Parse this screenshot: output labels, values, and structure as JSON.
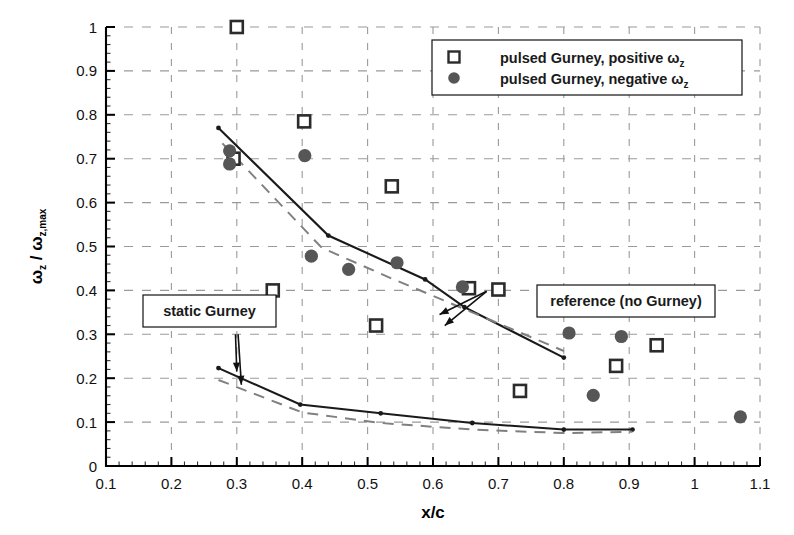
{
  "chart_data": {
    "type": "scatter",
    "title": "",
    "xlabel": "x/c",
    "ylabel": "ωz / ωz,max",
    "ylabel_parts": {
      "main1": "ω",
      "sub1": "z",
      "slash": " / ",
      "main2": "ω",
      "sub2": "z,max"
    },
    "xlim": [
      0.1,
      1.1
    ],
    "ylim": [
      0.0,
      1.0
    ],
    "xticks": [
      "0.1",
      "0.2",
      "0.3",
      "0.4",
      "0.5",
      "0.6",
      "0.7",
      "0.8",
      "0.9",
      "1",
      "1.1"
    ],
    "xtick_values": [
      0.1,
      0.2,
      0.3,
      0.4,
      0.5,
      0.6,
      0.7,
      0.8,
      0.9,
      1.0,
      1.1
    ],
    "yticks": [
      "0",
      "0.1",
      "0.2",
      "0.3",
      "0.4",
      "0.5",
      "0.6",
      "0.7",
      "0.8",
      "0.9",
      "1"
    ],
    "ytick_values": [
      0.0,
      0.1,
      0.2,
      0.3,
      0.4,
      0.5,
      0.6,
      0.7,
      0.8,
      0.9,
      1.0
    ],
    "grid": true,
    "grid_style": "dashed",
    "grid_color": "#9a9a9a",
    "minor_ticks_per_major": 5,
    "legend_position": "top-right",
    "series": [
      {
        "name": "pulsed Gurney, positive ωz",
        "marker": "open-square",
        "color": "#2b2b2b",
        "points": [
          {
            "x": 0.3,
            "y": 1.0
          },
          {
            "x": 0.295,
            "y": 0.7
          },
          {
            "x": 0.355,
            "y": 0.4
          },
          {
            "x": 0.403,
            "y": 0.785
          },
          {
            "x": 0.513,
            "y": 0.32
          },
          {
            "x": 0.537,
            "y": 0.637
          },
          {
            "x": 0.655,
            "y": 0.405
          },
          {
            "x": 0.7,
            "y": 0.402
          },
          {
            "x": 0.733,
            "y": 0.171
          },
          {
            "x": 0.88,
            "y": 0.228
          },
          {
            "x": 0.942,
            "y": 0.275
          }
        ]
      },
      {
        "name": "pulsed Gurney, negative ωz",
        "marker": "filled-circle",
        "color": "#565656",
        "points": [
          {
            "x": 0.289,
            "y": 0.718
          },
          {
            "x": 0.289,
            "y": 0.688
          },
          {
            "x": 0.404,
            "y": 0.707
          },
          {
            "x": 0.414,
            "y": 0.478
          },
          {
            "x": 0.471,
            "y": 0.448
          },
          {
            "x": 0.545,
            "y": 0.463
          },
          {
            "x": 0.645,
            "y": 0.408
          },
          {
            "x": 0.808,
            "y": 0.303
          },
          {
            "x": 0.845,
            "y": 0.161
          },
          {
            "x": 0.888,
            "y": 0.295
          },
          {
            "x": 1.07,
            "y": 0.112
          }
        ]
      }
    ],
    "curves": [
      {
        "name": "pulsed-gurney-trend-upper",
        "style": "solid",
        "color": "#1a1a1a",
        "points": [
          {
            "x": 0.272,
            "y": 0.77
          },
          {
            "x": 0.44,
            "y": 0.525
          },
          {
            "x": 0.588,
            "y": 0.425
          },
          {
            "x": 0.648,
            "y": 0.362
          },
          {
            "x": 0.8,
            "y": 0.247
          }
        ]
      },
      {
        "name": "reference-no-gurney-upper",
        "style": "dashed",
        "color": "#808080",
        "points": [
          {
            "x": 0.278,
            "y": 0.735
          },
          {
            "x": 0.43,
            "y": 0.497
          },
          {
            "x": 0.54,
            "y": 0.425
          },
          {
            "x": 0.66,
            "y": 0.35
          },
          {
            "x": 0.8,
            "y": 0.262
          }
        ]
      },
      {
        "name": "static-gurney-trend-lower",
        "style": "solid",
        "color": "#1a1a1a",
        "points": [
          {
            "x": 0.272,
            "y": 0.223
          },
          {
            "x": 0.397,
            "y": 0.14
          },
          {
            "x": 0.52,
            "y": 0.12
          },
          {
            "x": 0.66,
            "y": 0.098
          },
          {
            "x": 0.8,
            "y": 0.083
          },
          {
            "x": 0.905,
            "y": 0.083
          }
        ]
      },
      {
        "name": "reference-no-gurney-lower",
        "style": "dashed",
        "color": "#808080",
        "points": [
          {
            "x": 0.272,
            "y": 0.196
          },
          {
            "x": 0.4,
            "y": 0.122
          },
          {
            "x": 0.52,
            "y": 0.098
          },
          {
            "x": 0.66,
            "y": 0.083
          },
          {
            "x": 0.8,
            "y": 0.075
          },
          {
            "x": 0.905,
            "y": 0.078
          }
        ]
      }
    ],
    "annotations": [
      {
        "name": "static-gurney",
        "text": "static Gurney",
        "box_x": 0.155,
        "box_y": 0.335,
        "arrows": [
          {
            "from_x": 0.302,
            "from_y": 0.3,
            "to_x": 0.307,
            "to_y": 0.185
          },
          {
            "from_x": 0.298,
            "from_y": 0.3,
            "to_x": 0.3,
            "to_y": 0.215
          }
        ]
      },
      {
        "name": "reference-no-gurney",
        "text": "reference (no Gurney)",
        "box_x": 0.64,
        "box_y": 0.465,
        "arrows": [
          {
            "from_x": 0.682,
            "from_y": 0.398,
            "to_x": 0.61,
            "to_y": 0.345
          },
          {
            "from_x": 0.682,
            "from_y": 0.398,
            "to_x": 0.618,
            "to_y": 0.32
          }
        ]
      }
    ]
  },
  "legend": {
    "items": [
      {
        "marker": "open-square",
        "label": "pulsed Gurney, positive ",
        "symbol": "ω",
        "subscript": "z"
      },
      {
        "marker": "filled-circle",
        "label": "pulsed Gurney, negative ",
        "symbol": "ω",
        "subscript": "z"
      }
    ]
  },
  "axes": {
    "x_title": "x/c",
    "y_title_omega": "ω",
    "y_title_sub_z": "z",
    "y_title_slash": " / ",
    "y_title_sub_zmax": "z,max"
  },
  "colors": {
    "axis": "#000000",
    "grid": "#9a9a9a",
    "marker_open": "#2b2b2b",
    "marker_filled": "#565656",
    "trend_solid": "#1a1a1a",
    "trend_dashed": "#808080",
    "background": "#ffffff"
  }
}
